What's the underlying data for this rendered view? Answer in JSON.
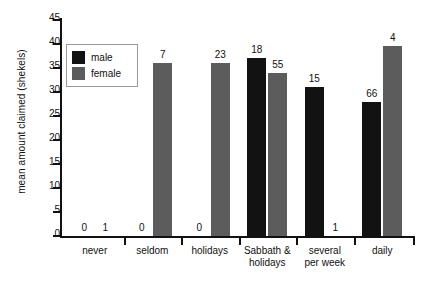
{
  "chart_data": {
    "type": "bar",
    "title": "",
    "xlabel": "",
    "ylabel": "mean amount claimed (shekels)",
    "ylim": [
      0,
      45
    ],
    "yticks": [
      0,
      5,
      10,
      15,
      20,
      25,
      30,
      35,
      40,
      45
    ],
    "grid": false,
    "legend_position": "top-left",
    "categories": [
      "never",
      "seldom",
      "holidays",
      "Sabbath &\nholidays",
      "several\nper week",
      "daily"
    ],
    "series": [
      {
        "name": "male",
        "color": "#121212",
        "values": [
          0,
          0,
          0,
          37,
          31,
          28
        ],
        "point_labels": [
          "0",
          "0",
          "0",
          "18",
          "15",
          "66"
        ]
      },
      {
        "name": "female",
        "color": "#5c5c5c",
        "values": [
          0,
          36,
          36,
          34,
          0,
          39.5
        ],
        "point_labels": [
          "1",
          "7",
          "23",
          "55",
          "1",
          "4"
        ]
      }
    ]
  },
  "legend": {
    "items": [
      {
        "label": "male",
        "color": "#121212"
      },
      {
        "label": "female",
        "color": "#5c5c5c"
      }
    ]
  },
  "axis": {
    "y_title": "mean amount claimed (shekels)",
    "y_tick_labels": [
      "45",
      "40",
      "35",
      "30",
      "25",
      "20",
      "15",
      "10",
      "5",
      "0"
    ]
  }
}
